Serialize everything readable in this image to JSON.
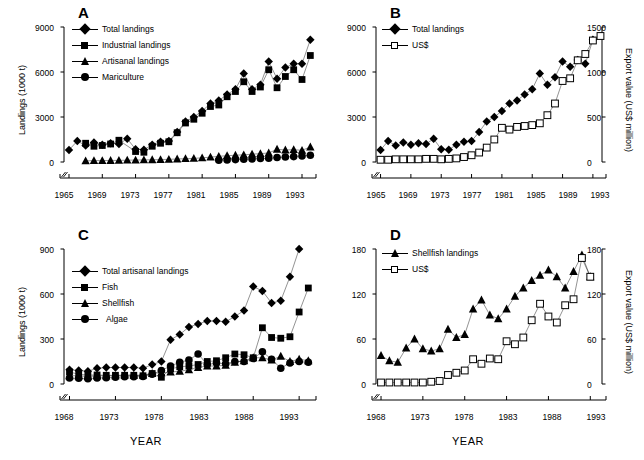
{
  "figure": {
    "background": "#ffffff",
    "marker_color": "#000000",
    "open_marker_fill": "#ffffff"
  },
  "panels": {
    "A": {
      "letter": "A",
      "ylabel": "Landings   (1000 t)",
      "xlabel": "",
      "yticks": [
        "0",
        "3000",
        "6000",
        "9000"
      ],
      "xticks": [
        "1965",
        "1969",
        "1973",
        "1977",
        "1981",
        "1985",
        "1989",
        "1993"
      ],
      "legend": [
        {
          "label": "Total landings",
          "marker": "diamond"
        },
        {
          "label": "Industrial landings",
          "marker": "square"
        },
        {
          "label": "Artisanal landings",
          "marker": "triangle"
        },
        {
          "label": "Mariculture",
          "marker": "circle"
        }
      ]
    },
    "B": {
      "letter": "B",
      "ylabel": "",
      "ylabel_right": "Export value (US$ million)",
      "xlabel": "",
      "yticks": [
        "0",
        "3000",
        "6000",
        "9000"
      ],
      "yticks_right": [
        "0",
        "500",
        "1000",
        "1500"
      ],
      "xticks": [
        "1965",
        "1969",
        "1973",
        "1977",
        "1981",
        "1985",
        "1989",
        "1993"
      ],
      "legend": [
        {
          "label": "Total landings",
          "marker": "diamond"
        },
        {
          "label": "US$",
          "marker": "square-open"
        }
      ]
    },
    "C": {
      "letter": "C",
      "ylabel": "Landings   (1000 t)",
      "xlabel": "YEAR",
      "yticks": [
        "0",
        "300",
        "600",
        "900"
      ],
      "xticks": [
        "1968",
        "1973",
        "1978",
        "1983",
        "1988",
        "1993"
      ],
      "legend": [
        {
          "label": "Total artisanal landings",
          "marker": "diamond"
        },
        {
          "label": "Fish",
          "marker": "square"
        },
        {
          "label": "Shellfish",
          "marker": "triangle"
        },
        {
          "label": "Algae",
          "marker": "circle"
        }
      ]
    },
    "D": {
      "letter": "D",
      "ylabel": "",
      "ylabel_right": "Export value (US$ million)",
      "xlabel": "YEAR",
      "yticks": [
        "0",
        "60",
        "120",
        "180"
      ],
      "yticks_right": [
        "0",
        "60",
        "120",
        "180"
      ],
      "xticks": [
        "1968",
        "1973",
        "1978",
        "1983",
        "1988",
        "1993"
      ],
      "legend": [
        {
          "label": "Shellfish  landings",
          "marker": "triangle"
        },
        {
          "label": "US$",
          "marker": "square-open"
        }
      ]
    }
  },
  "chart_data": [
    {
      "panel": "A",
      "type": "scatter",
      "title": "A",
      "xlabel": "",
      "ylabel": "Landings (1000 t)",
      "xlim": [
        1964.4,
        1994.2
      ],
      "ylim": [
        0,
        9000
      ],
      "yticks": [
        0,
        3000,
        6000,
        9000
      ],
      "xticks": [
        1965,
        1969,
        1973,
        1977,
        1981,
        1985,
        1989,
        1993
      ],
      "grid": false,
      "axis_break_x": true,
      "legend_position": "upper-left",
      "x": [
        1965,
        1966,
        1967,
        1968,
        1969,
        1970,
        1971,
        1972,
        1973,
        1974,
        1975,
        1976,
        1977,
        1978,
        1979,
        1980,
        1981,
        1982,
        1983,
        1984,
        1985,
        1986,
        1987,
        1988,
        1989,
        1990,
        1991,
        1992,
        1993,
        1994
      ],
      "series": [
        {
          "name": "Total landings",
          "marker": "diamond",
          "values": [
            800,
            1400,
            1100,
            1300,
            1150,
            1250,
            1200,
            1550,
            850,
            820,
            1150,
            1350,
            1400,
            2000,
            2700,
            3000,
            3400,
            3900,
            4100,
            4500,
            4850,
            5900,
            4850,
            5150,
            6700,
            5550,
            6300,
            6550,
            6550,
            8150
          ]
        },
        {
          "name": "Industrial landings",
          "marker": "square",
          "values": [
            null,
            null,
            1250,
            1050,
            1100,
            1200,
            1450,
            null,
            700,
            650,
            1050,
            1250,
            1350,
            1950,
            2600,
            2850,
            3250,
            3700,
            3800,
            4350,
            4700,
            5350,
            4700,
            5000,
            6150,
            4950,
            5700,
            6150,
            5500,
            7100
          ]
        },
        {
          "name": "Artisanal landings",
          "marker": "triangle",
          "values": [
            null,
            null,
            80,
            90,
            95,
            100,
            110,
            120,
            130,
            140,
            150,
            160,
            180,
            200,
            220,
            240,
            280,
            320,
            380,
            420,
            450,
            480,
            520,
            560,
            600,
            850,
            800,
            820,
            780,
            1000
          ]
        },
        {
          "name": "Mariculture",
          "marker": "circle",
          "values": [
            null,
            null,
            null,
            null,
            null,
            null,
            null,
            null,
            null,
            null,
            null,
            null,
            null,
            null,
            null,
            null,
            null,
            null,
            120,
            140,
            160,
            180,
            200,
            230,
            250,
            300,
            330,
            360,
            400,
            450
          ]
        }
      ]
    },
    {
      "panel": "B",
      "type": "scatter",
      "title": "B",
      "xlabel": "",
      "ylabel": "Landings (1000 t)",
      "ylabel_right": "Export value (US$ million)",
      "xlim": [
        1964.4,
        1994.2
      ],
      "ylim": [
        0,
        9000
      ],
      "ylim_right": [
        0,
        1500
      ],
      "yticks": [
        0,
        3000,
        6000,
        9000
      ],
      "yticks_right": [
        0,
        500,
        1000,
        1500
      ],
      "xticks": [
        1965,
        1969,
        1973,
        1977,
        1981,
        1985,
        1989,
        1993
      ],
      "grid": false,
      "axis_break_x": true,
      "legend_position": "upper-left",
      "x": [
        1965,
        1966,
        1967,
        1968,
        1969,
        1970,
        1971,
        1972,
        1973,
        1974,
        1975,
        1976,
        1977,
        1978,
        1979,
        1980,
        1981,
        1982,
        1983,
        1984,
        1985,
        1986,
        1987,
        1988,
        1989,
        1990,
        1991,
        1992,
        1993,
        1994
      ],
      "series": [
        {
          "name": "Total landings",
          "marker": "diamond",
          "axis": "left",
          "values": [
            800,
            1400,
            1100,
            1300,
            1150,
            1250,
            1200,
            1550,
            850,
            820,
            1150,
            1350,
            1400,
            2000,
            2700,
            3000,
            3400,
            3900,
            4100,
            4500,
            4850,
            5900,
            5150,
            5650,
            6700,
            6350,
            6800,
            6550,
            8150,
            null
          ]
        },
        {
          "name": "US$",
          "marker": "square-open",
          "axis": "right",
          "values": [
            25,
            25,
            30,
            30,
            30,
            30,
            35,
            35,
            30,
            35,
            40,
            55,
            75,
            105,
            160,
            250,
            380,
            360,
            390,
            400,
            410,
            430,
            520,
            650,
            900,
            930,
            1130,
            1200,
            1350,
            1400
          ]
        }
      ]
    },
    {
      "panel": "C",
      "type": "scatter",
      "title": "C",
      "xlabel": "YEAR",
      "ylabel": "Landings (1000 t)",
      "xlim": [
        1967.4,
        1994.4
      ],
      "ylim": [
        0,
        900
      ],
      "yticks": [
        0,
        300,
        600,
        900
      ],
      "xticks": [
        1968,
        1973,
        1978,
        1983,
        1988,
        1993
      ],
      "grid": false,
      "axis_break_x": true,
      "legend_position": "upper-left",
      "x": [
        1968,
        1969,
        1970,
        1971,
        1972,
        1973,
        1974,
        1975,
        1976,
        1977,
        1978,
        1979,
        1980,
        1981,
        1982,
        1983,
        1984,
        1985,
        1986,
        1987,
        1988,
        1989,
        1990,
        1991,
        1992,
        1993,
        1994
      ],
      "series": [
        {
          "name": "Total artisanal landings",
          "marker": "diamond",
          "values": [
            95,
            90,
            85,
            105,
            110,
            110,
            110,
            110,
            105,
            130,
            150,
            295,
            330,
            380,
            400,
            420,
            420,
            415,
            450,
            490,
            650,
            620,
            540,
            555,
            715,
            900,
            null
          ]
        },
        {
          "name": "Fish",
          "marker": "square",
          "values": [
            80,
            65,
            60,
            60,
            58,
            58,
            58,
            58,
            55,
            70,
            45,
            100,
            115,
            120,
            130,
            150,
            155,
            175,
            200,
            195,
            175,
            375,
            310,
            305,
            315,
            480,
            640
          ]
        },
        {
          "name": "Shellfish",
          "marker": "triangle",
          "values": [
            55,
            55,
            50,
            55,
            55,
            55,
            60,
            58,
            60,
            70,
            75,
            80,
            85,
            95,
            110,
            120,
            120,
            125,
            145,
            155,
            175,
            175,
            160,
            185,
            150,
            165,
            155
          ]
        },
        {
          "name": "Algae",
          "marker": "circle",
          "values": [
            40,
            38,
            35,
            40,
            42,
            45,
            48,
            48,
            50,
            65,
            90,
            120,
            145,
            160,
            200,
            130,
            140,
            135,
            150,
            150,
            170,
            215,
            165,
            105,
            140,
            150,
            145
          ]
        }
      ]
    },
    {
      "panel": "D",
      "type": "scatter",
      "title": "D",
      "xlabel": "YEAR",
      "ylabel": "Shellfish landings (1000 t)",
      "ylabel_right": "Export value (US$ million)",
      "xlim": [
        1967.4,
        1994.4
      ],
      "ylim": [
        0,
        180
      ],
      "ylim_right": [
        0,
        180
      ],
      "yticks": [
        0,
        60,
        120,
        180
      ],
      "yticks_right": [
        0,
        60,
        120,
        180
      ],
      "xticks": [
        1968,
        1973,
        1978,
        1983,
        1988,
        1993
      ],
      "grid": false,
      "axis_break_x": true,
      "legend_position": "upper-left",
      "x": [
        1968,
        1969,
        1970,
        1971,
        1972,
        1973,
        1974,
        1975,
        1976,
        1977,
        1978,
        1979,
        1980,
        1981,
        1982,
        1983,
        1984,
        1985,
        1986,
        1987,
        1988,
        1989,
        1990,
        1991,
        1992,
        1993
      ],
      "series": [
        {
          "name": "Shellfish landings",
          "marker": "triangle",
          "axis": "left",
          "values": [
            38,
            31,
            29,
            48,
            60,
            47,
            44,
            47,
            73,
            62,
            66,
            100,
            112,
            92,
            87,
            100,
            117,
            128,
            138,
            145,
            152,
            143,
            128,
            150,
            172,
            143
          ]
        },
        {
          "name": "US$",
          "marker": "square-open",
          "axis": "right",
          "values": [
            2,
            2,
            2,
            2,
            2,
            2,
            3,
            4,
            12,
            15,
            18,
            33,
            27,
            34,
            33,
            57,
            53,
            62,
            85,
            107,
            90,
            82,
            105,
            113,
            168,
            143
          ]
        }
      ]
    }
  ]
}
